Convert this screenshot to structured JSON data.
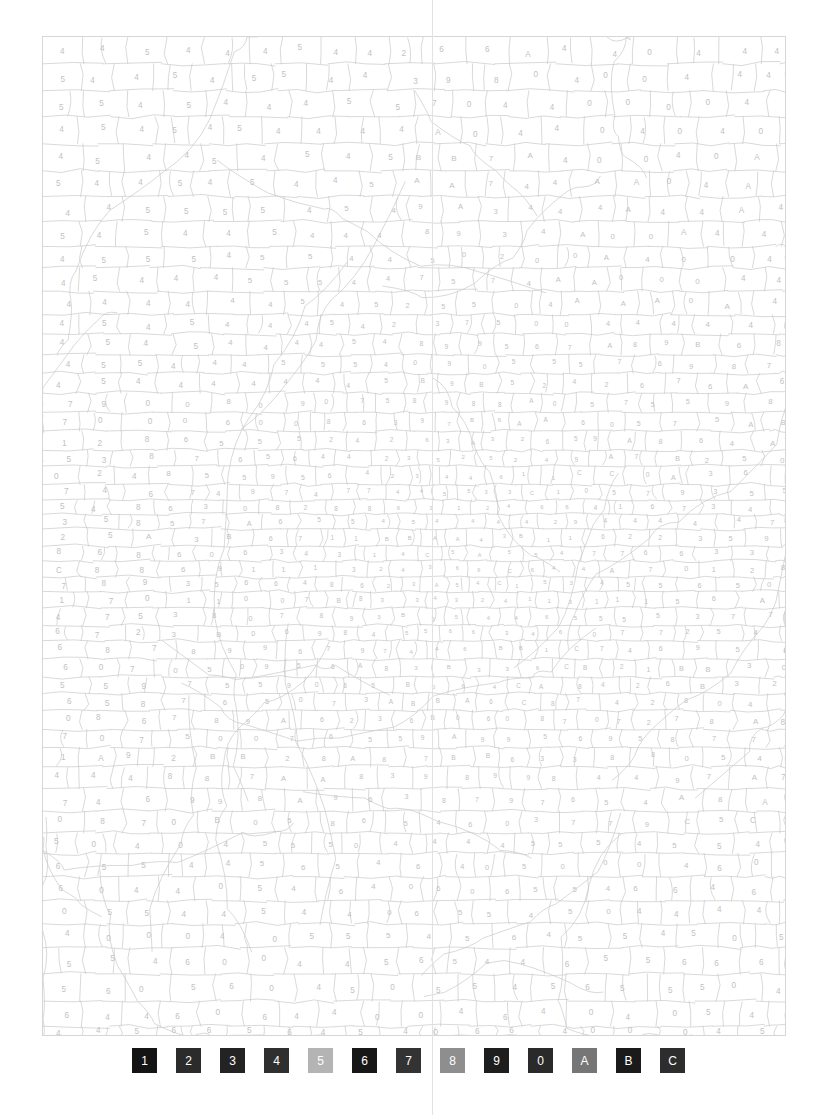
{
  "page": {
    "kind": "color-by-number-puzzle-sheet",
    "background_color": "#ffffff",
    "crop_guide_color": "#e2e2e2",
    "crop_guide_x": 432
  },
  "puzzle": {
    "border_color": "#d6d6d6",
    "cell_edge_color": "#c9c9c9",
    "label_color": "#c2c2c2",
    "x": 42,
    "y": 36,
    "width": 744,
    "height": 1000,
    "symbols_used": [
      "1",
      "2",
      "3",
      "4",
      "5",
      "6",
      "7",
      "8",
      "9",
      "0",
      "A",
      "B",
      "C"
    ],
    "region_notes": {
      "top_left": "mostly 4 and 5",
      "top_right": "mostly 4, A, 0",
      "center": "dense small cells with 0, 1, 2, 3, 9, A, B",
      "bottom_left": "mostly 4, 5, 6",
      "bottom_right": "mostly 4, 5, 0"
    }
  },
  "legend": {
    "name": "color-key",
    "swatches": [
      {
        "label": "1",
        "color": "#141414",
        "text_color": "#ffffff"
      },
      {
        "label": "2",
        "color": "#2b2b2b",
        "text_color": "#ffffff"
      },
      {
        "label": "3",
        "color": "#232323",
        "text_color": "#ffffff"
      },
      {
        "label": "4",
        "color": "#2f2f2f",
        "text_color": "#ffffff"
      },
      {
        "label": "5",
        "color": "#b4b4b4",
        "text_color": "#ffffff"
      },
      {
        "label": "6",
        "color": "#171717",
        "text_color": "#ffffff"
      },
      {
        "label": "7",
        "color": "#333333",
        "text_color": "#ffffff"
      },
      {
        "label": "8",
        "color": "#8e8e8e",
        "text_color": "#ffffff"
      },
      {
        "label": "9",
        "color": "#1e1e1e",
        "text_color": "#ffffff"
      },
      {
        "label": "0",
        "color": "#2a2a2a",
        "text_color": "#ffffff"
      },
      {
        "label": "A",
        "color": "#767676",
        "text_color": "#ffffff"
      },
      {
        "label": "B",
        "color": "#1a1a1a",
        "text_color": "#ffffff"
      },
      {
        "label": "C",
        "color": "#2d2d2d",
        "text_color": "#ffffff"
      }
    ]
  }
}
